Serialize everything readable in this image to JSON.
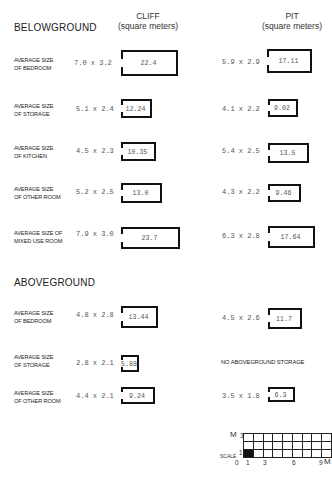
{
  "headers": {
    "belowground": "BELOWGROUND",
    "aboveground": "ABOVEGROUND",
    "cliff_title": "CLIFF",
    "cliff_units": "(square meters)",
    "pit_title": "PIT",
    "pit_units": "(square meters)"
  },
  "belowground": [
    {
      "label1": "AVERAGE SIZE",
      "label2": "OF BEDROOM",
      "cliff_dims": "7.0 x 3.2",
      "cliff_area": "22.4",
      "pit_dims": "5.9 x 2.9",
      "pit_area": "17.11"
    },
    {
      "label1": "AVERAGE SIZE",
      "label2": "OF STORAGE",
      "cliff_dims": "5.1 x 2.4",
      "cliff_area": "12.24",
      "pit_dims": "4.1 x 2.2",
      "pit_area": "9.02"
    },
    {
      "label1": "AVERAGE SIZE",
      "label2": "OF KITCHEN",
      "cliff_dims": "4.5 x 2.3",
      "cliff_area": "10.35",
      "pit_dims": "5.4 x 2.5",
      "pit_area": "13.5"
    },
    {
      "label1": "AVERAGE SIZE",
      "label2": "OF OTHER ROOM",
      "cliff_dims": "5.2 x 2.5",
      "cliff_area": "13.0",
      "pit_dims": "4.3 x 2.2",
      "pit_area": "9.46"
    },
    {
      "label1": "AVERAGE SIZE OF",
      "label2": "MIXED USE ROOM",
      "cliff_dims": "7.9 x 3.0",
      "cliff_area": "23.7",
      "pit_dims": "6.3 x 2.8",
      "pit_area": "17.64"
    }
  ],
  "aboveground": [
    {
      "label1": "AVERAGE SIZE",
      "label2": "OF BEDROOM",
      "cliff_dims": "4.8 x 2.8",
      "cliff_area": "13.44",
      "pit_dims": "4.5 x 2.6",
      "pit_area": "11.7"
    },
    {
      "label1": "AVERAGE SIZE",
      "label2": "OF STORAGE",
      "cliff_dims": "2.8 x 2.1",
      "cliff_area": "5.88",
      "pit_note": "NO ABOVEGROUND STORAGE"
    },
    {
      "label1": "AVERAGE SIZE",
      "label2": "OF OTHER ROOM",
      "cliff_dims": "4.4 x 2.1",
      "cliff_area": "9.24",
      "pit_dims": "3.5 x 1.8",
      "pit_area": "6.3"
    }
  ],
  "scale": {
    "label": "SCALE",
    "unit_y": "M",
    "unit_x": "M",
    "y_ticks": [
      "3",
      "1",
      "0"
    ],
    "x_ticks": [
      "0",
      "1",
      "3",
      "6",
      "9"
    ],
    "columns": 9,
    "rows": 3
  }
}
